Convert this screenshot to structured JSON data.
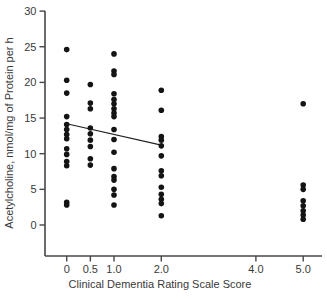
{
  "chart_data": {
    "type": "scatter",
    "title": "",
    "xlabel": "Clinical Dementia Rating Scale Score",
    "ylabel": "Acetylcholine, nmol/mg of Protein per h",
    "x_tick_values": [
      0,
      0.5,
      1.0,
      2.0,
      4.0,
      5.0
    ],
    "x_tick_labels": [
      "0",
      "0.5",
      "1.0",
      "2.0",
      "4.0",
      "5.0"
    ],
    "y_tick_values": [
      0,
      5,
      10,
      15,
      20,
      25,
      30
    ],
    "y_tick_labels": [
      "0",
      "5",
      "10",
      "15",
      "20",
      "25",
      "30"
    ],
    "xlim": [
      -0.46,
      5.4
    ],
    "ylim": [
      -4.4,
      30
    ],
    "grid": false,
    "legend": "none",
    "marker_color": "#141414",
    "axis_color": "#474747",
    "label_color": "#3a3a3a",
    "series": [
      {
        "name": "acetylcholine-by-cdr-score",
        "points": [
          [
            0,
            24.6
          ],
          [
            0,
            20.3
          ],
          [
            0,
            18.5
          ],
          [
            0,
            15.2
          ],
          [
            0,
            14.1
          ],
          [
            0,
            13.4
          ],
          [
            0,
            12.7
          ],
          [
            0,
            12.1
          ],
          [
            0,
            10.7
          ],
          [
            0,
            9.9
          ],
          [
            0,
            8.9
          ],
          [
            0,
            8.3
          ],
          [
            0,
            3.2
          ],
          [
            0,
            2.8
          ],
          [
            0.5,
            19.7
          ],
          [
            0.5,
            17.1
          ],
          [
            0.5,
            16.3
          ],
          [
            0.5,
            13.6
          ],
          [
            0.5,
            12.8
          ],
          [
            0.5,
            11.9
          ],
          [
            0.5,
            11.0
          ],
          [
            0.5,
            9.3
          ],
          [
            0.5,
            8.4
          ],
          [
            1.0,
            24.0
          ],
          [
            1.0,
            21.6
          ],
          [
            1.0,
            21.1
          ],
          [
            1.0,
            18.4
          ],
          [
            1.0,
            17.6
          ],
          [
            1.0,
            17.0
          ],
          [
            1.0,
            16.3
          ],
          [
            1.0,
            15.7
          ],
          [
            1.0,
            15.2
          ],
          [
            1.0,
            13.4
          ],
          [
            1.0,
            12.0
          ],
          [
            1.0,
            10.2
          ],
          [
            1.0,
            7.9
          ],
          [
            1.0,
            6.8
          ],
          [
            1.0,
            6.3
          ],
          [
            1.0,
            5.0
          ],
          [
            1.0,
            4.2
          ],
          [
            1.0,
            2.8
          ],
          [
            2.0,
            18.9
          ],
          [
            2.0,
            16.1
          ],
          [
            2.0,
            12.4
          ],
          [
            2.0,
            11.9
          ],
          [
            2.0,
            11.1
          ],
          [
            2.0,
            9.7
          ],
          [
            2.0,
            7.6
          ],
          [
            2.0,
            6.9
          ],
          [
            2.0,
            5.3
          ],
          [
            2.0,
            4.3
          ],
          [
            2.0,
            3.6
          ],
          [
            2.0,
            3.0
          ],
          [
            2.0,
            1.3
          ],
          [
            5.0,
            17.0
          ],
          [
            5.0,
            5.6
          ],
          [
            5.0,
            5.0
          ],
          [
            5.0,
            3.4
          ],
          [
            5.0,
            2.7
          ],
          [
            5.0,
            2.0
          ],
          [
            5.0,
            1.4
          ],
          [
            5.0,
            0.8
          ]
        ]
      }
    ],
    "trend_line": {
      "x1": 0,
      "y1": 14.2,
      "x2": 2.0,
      "y2": 11.2
    }
  }
}
